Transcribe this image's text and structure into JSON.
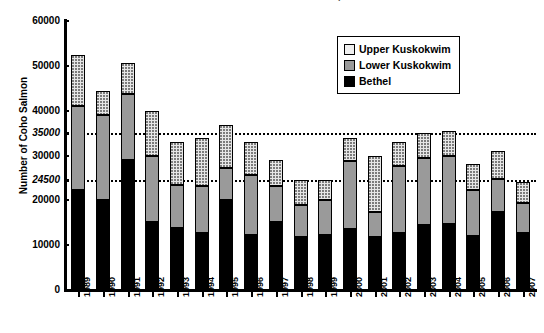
{
  "chart_data": {
    "type": "bar",
    "subtype": "stacked-column",
    "title": "Kuskokwim River Coho Salmon Escapement",
    "xlabel": "",
    "ylabel": "Number of Coho Salmon",
    "ylim": [
      0,
      60000
    ],
    "ytick_values": [
      0,
      10000,
      20000,
      30000,
      40000,
      50000,
      60000
    ],
    "ytick_labels": [
      "0",
      "10000",
      "20000",
      "30000",
      "40000",
      "50000",
      "60000"
    ],
    "grid": false,
    "legend_position": "top-right",
    "categories": [
      "1989",
      "1990",
      "1991",
      "1992",
      "1993",
      "1994",
      "1995",
      "1996",
      "1997",
      "1998",
      "1999",
      "2000",
      "2001",
      "2002",
      "2003",
      "2004",
      "2005",
      "2006",
      "2007"
    ],
    "series": [
      {
        "name": "Bethel",
        "color": "#000000",
        "values": [
          22300,
          20000,
          29000,
          15200,
          13800,
          12800,
          20000,
          12300,
          15200,
          11800,
          12300,
          13600,
          11800,
          12800,
          14600,
          14800,
          12000,
          17500,
          12800
        ]
      },
      {
        "name": "Lower Kuskokwim",
        "color": "#9a9a9a",
        "values": [
          18700,
          19000,
          14800,
          14800,
          9600,
          10300,
          7200,
          13400,
          8100,
          7200,
          7800,
          15200,
          5700,
          14800,
          14800,
          15100,
          10300,
          7200,
          6700
        ]
      },
      {
        "name": "Upper Kuskokwim",
        "color": "#e6e6e6",
        "values": [
          11500,
          5500,
          6900,
          10000,
          9600,
          10900,
          9600,
          7300,
          5700,
          5500,
          4400,
          5200,
          12500,
          5400,
          5600,
          5600,
          5700,
          6300,
          4500
        ]
      }
    ],
    "totals": [
      52500,
      44500,
      50700,
      40000,
      33000,
      34000,
      36800,
      33000,
      29000,
      24500,
      24500,
      34000,
      30000,
      33000,
      35000,
      35500,
      28000,
      31000,
      24000
    ],
    "reference_lines": [
      {
        "value": 35000,
        "label": "35000",
        "style": "dotted"
      },
      {
        "value": 24500,
        "label": "24500",
        "style": "dotted"
      }
    ]
  },
  "legend": {
    "entries": [
      {
        "label": "Upper Kuskokwim",
        "swatch": "upper"
      },
      {
        "label": "Lower Kuskokwim",
        "swatch": "lower"
      },
      {
        "label": "Bethel",
        "swatch": "bethel"
      }
    ]
  }
}
